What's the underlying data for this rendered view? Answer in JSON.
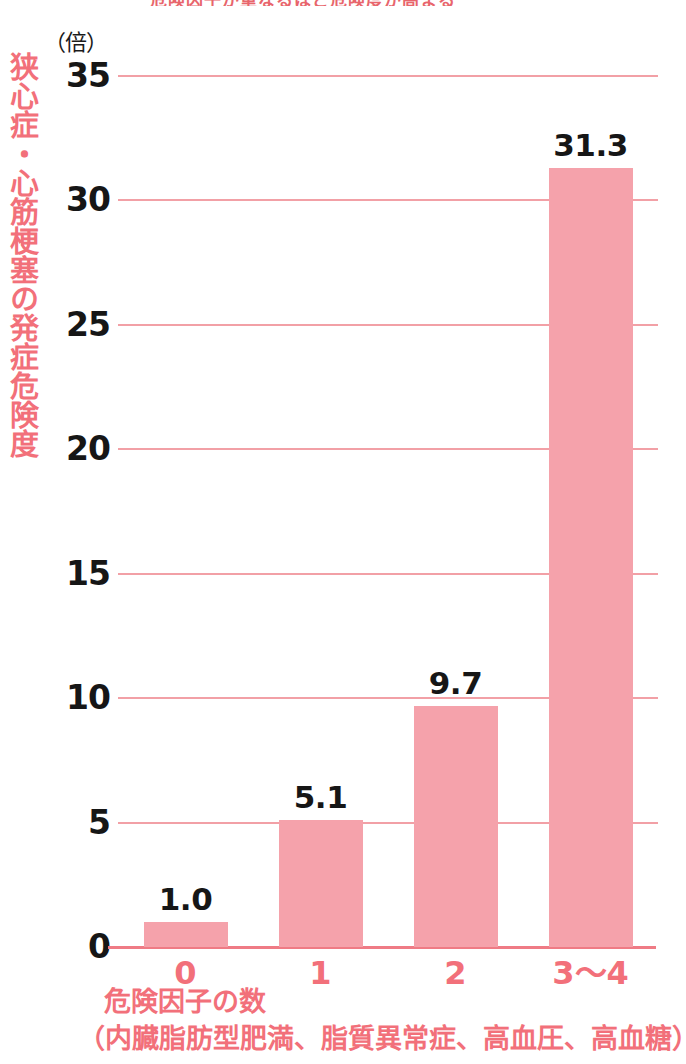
{
  "chart_data": {
    "type": "bar",
    "title": "",
    "categories": [
      "0",
      "1",
      "2",
      "3〜4"
    ],
    "values": [
      1.0,
      5.1,
      9.7,
      31.3
    ],
    "value_labels": [
      "1.0",
      "5.1",
      "9.7",
      "31.3"
    ],
    "ylabel": "狭心症・心筋梗塞の発症危険度",
    "yunit": "（倍）",
    "xlabel": "危険因子の数",
    "xlabel_note": "（内臓脂肪型肥満、脂質異常症、高血圧、高血糖）",
    "ylim": [
      0,
      35
    ],
    "yticks": [
      "0",
      "5",
      "10",
      "15",
      "20",
      "25",
      "30",
      "35"
    ],
    "ytick_values": [
      0,
      5,
      10,
      15,
      20,
      25,
      30,
      35
    ],
    "grid": true,
    "legend": false,
    "colors": {
      "bar_fill": "#f5a2ab",
      "gridline": "#f2a0a6",
      "axis_line": "#ef7b85",
      "axis_text": "#f2707a",
      "value_text": "#161616",
      "tick_text": "#161616",
      "background": "#ffffff"
    }
  },
  "top_remnant": {
    "text": "危険因子が重なるほど危険度が高まる"
  }
}
